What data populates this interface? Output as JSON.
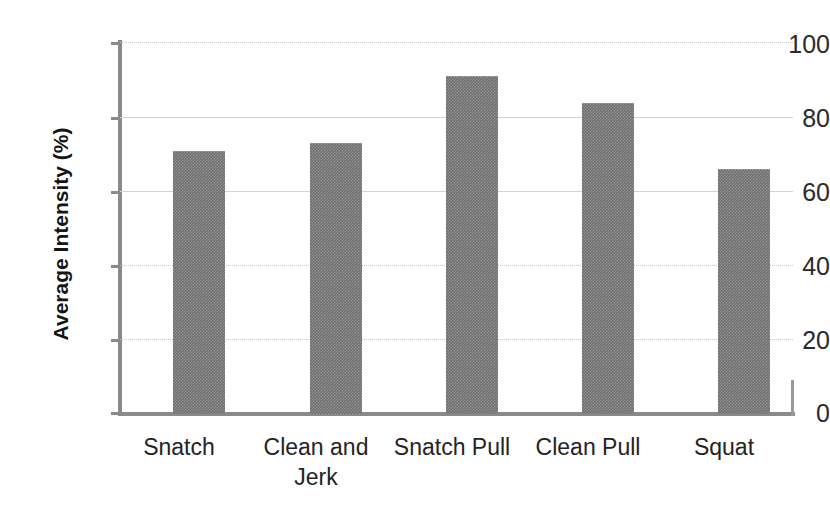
{
  "chart_data": {
    "type": "bar",
    "title": "",
    "xlabel": "",
    "ylabel": "Average Intensity (%)",
    "categories": [
      "Snatch",
      "Clean and Jerk",
      "Snatch Pull",
      "Clean Pull",
      "Squat"
    ],
    "values": [
      70.5,
      72.5,
      90.5,
      83.2,
      65.5
    ],
    "ylim": [
      0,
      100
    ],
    "yticks": [
      0,
      20,
      40,
      60,
      80,
      100
    ],
    "ytick_labels": [
      "0",
      "20",
      "40",
      "60",
      "80",
      "100"
    ],
    "grid": true,
    "grid_axis": "y",
    "legend": false,
    "bar_color": "#6f6f6f",
    "series": [
      {
        "name": "Average Intensity",
        "values": [
          70.5,
          72.5,
          90.5,
          83.2,
          65.5
        ]
      }
    ]
  },
  "axis": {
    "y_title": "Average Intensity (%)",
    "tick_0": "0",
    "tick_20": "20",
    "tick_40": "40",
    "tick_60": "60",
    "tick_80": "80",
    "tick_100": "100"
  },
  "categories": {
    "c0_line1": "Snatch",
    "c0_line2": "",
    "c1_line1": "Clean and",
    "c1_line2": "Jerk",
    "c2_line1": "Snatch Pull",
    "c2_line2": "",
    "c3_line1": "Clean Pull",
    "c3_line2": "",
    "c4_line1": "Squat",
    "c4_line2": ""
  }
}
